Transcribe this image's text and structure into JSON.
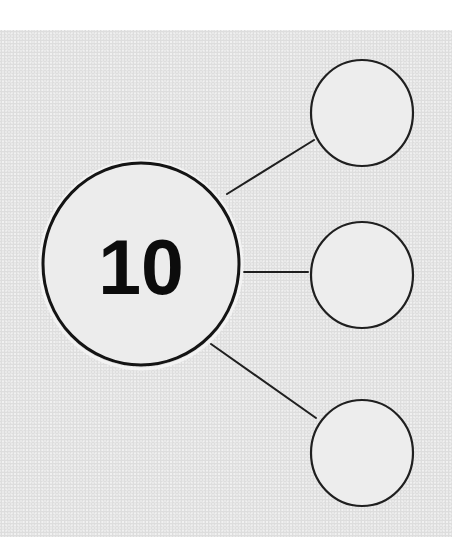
{
  "diagram": {
    "type": "number-bond",
    "whole": {
      "label": "10",
      "cx": 141,
      "cy": 264,
      "rx": 98,
      "ry": 101
    },
    "parts": [
      {
        "label": "",
        "cx": 362,
        "cy": 113,
        "r": 52
      },
      {
        "label": "",
        "cx": 362,
        "cy": 275,
        "r": 52
      },
      {
        "label": "",
        "cx": 362,
        "cy": 453,
        "r": 52
      }
    ],
    "connectors": [
      {
        "x1": 227,
        "y1": 194,
        "x2": 314,
        "y2": 140
      },
      {
        "x1": 244,
        "y1": 272,
        "x2": 308,
        "y2": 272
      },
      {
        "x1": 211,
        "y1": 344,
        "x2": 316,
        "y2": 418
      }
    ],
    "colors": {
      "paper": "#e9e9e9",
      "stroke": "#1a1a1a",
      "circle_fill": "#eeeeee"
    }
  }
}
